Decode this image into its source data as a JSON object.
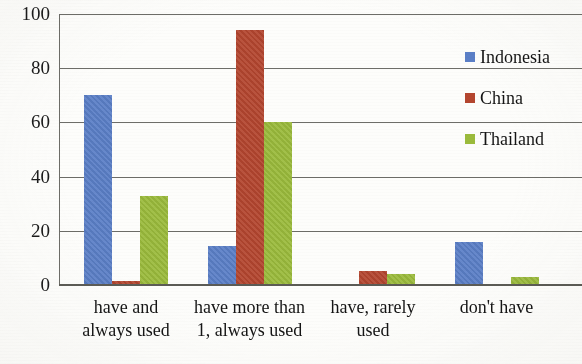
{
  "chart_data": {
    "type": "bar",
    "title": "",
    "subtitle": "",
    "xlabel": "",
    "ylabel": "",
    "categories": [
      "have and\nalways used",
      "have more than\n1, always used",
      "have, rarely\nused",
      "don't have"
    ],
    "category_lines": [
      [
        "have and",
        "always used"
      ],
      [
        "have more than",
        "1, always used"
      ],
      [
        "have, rarely",
        "used"
      ],
      [
        "don't have",
        ""
      ]
    ],
    "series": [
      {
        "name": "Indonesia",
        "color": "#5b7fc7",
        "values": [
          70,
          14.5,
          0,
          16
        ]
      },
      {
        "name": "China",
        "color": "#b4462f",
        "values": [
          1.5,
          94,
          5,
          0
        ]
      },
      {
        "name": "Thailand",
        "color": "#9bbb3c",
        "values": [
          33,
          60,
          4,
          3
        ]
      }
    ],
    "ylim": [
      0,
      100
    ],
    "yticks": [
      0,
      20,
      40,
      60,
      80,
      100
    ],
    "ytick_labels": [
      "0",
      "20",
      "40",
      "60",
      "80",
      "100"
    ],
    "grid": true,
    "grid_axis": "y",
    "legend_position": "right"
  },
  "legend": {
    "entries": [
      {
        "label": "Indonesia",
        "color": "#5b7fc7"
      },
      {
        "label": "China",
        "color": "#b4462f"
      },
      {
        "label": "Thailand",
        "color": "#9bbb3c"
      }
    ]
  }
}
